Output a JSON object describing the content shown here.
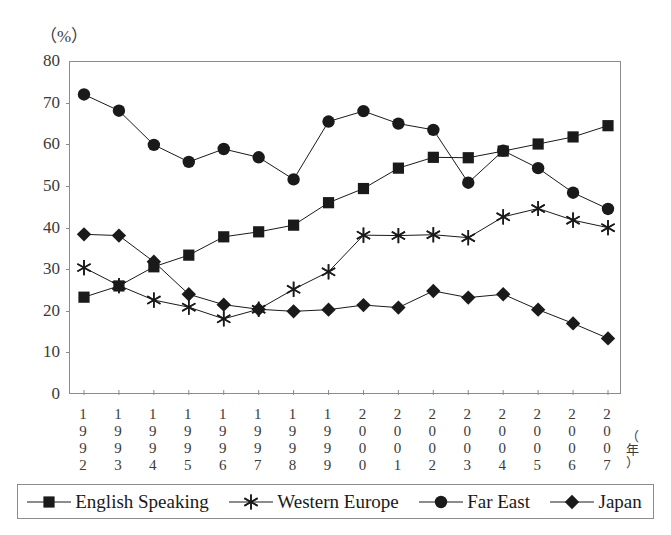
{
  "page": {
    "faint_header": "",
    "unit_label": "（%）",
    "year_axis_label": "（年）"
  },
  "chart_data": {
    "type": "line",
    "title": "",
    "xlabel": "（年）",
    "ylabel": "（%）",
    "ylim": [
      0,
      80
    ],
    "ytick_step": 10,
    "yticks": [
      "0",
      "10",
      "20",
      "30",
      "40",
      "50",
      "60",
      "70",
      "80"
    ],
    "grid": false,
    "legend_position": "bottom",
    "categories": [
      "1992",
      "1993",
      "1994",
      "1995",
      "1996",
      "1997",
      "1998",
      "1999",
      "2000",
      "2001",
      "2002",
      "2003",
      "2004",
      "2005",
      "2006",
      "2007"
    ],
    "series": [
      {
        "name": "English Speaking",
        "marker": "square",
        "color": "#1a1a1a",
        "values": [
          23.5,
          26.2,
          30.8,
          33.6,
          38.0,
          39.2,
          40.8,
          46.2,
          49.6,
          54.5,
          57.1,
          57.0,
          58.6,
          60.3,
          62.0,
          64.7
        ]
      },
      {
        "name": "Western Europe",
        "marker": "star",
        "color": "#1a1a1a",
        "values": [
          30.6,
          26.3,
          22.8,
          21.1,
          18.3,
          20.6,
          25.4,
          29.6,
          38.4,
          38.3,
          38.5,
          37.8,
          42.8,
          44.8,
          42.0,
          40.2
        ]
      },
      {
        "name": "Far East",
        "marker": "circle",
        "color": "#1a1a1a",
        "values": [
          72.2,
          68.3,
          60.1,
          56.0,
          59.1,
          57.1,
          51.8,
          65.7,
          68.2,
          65.2,
          63.7,
          51.0,
          58.7,
          54.5,
          48.6,
          44.7
        ]
      },
      {
        "name": "Japan",
        "marker": "diamond",
        "color": "#1a1a1a",
        "values": [
          38.6,
          38.3,
          32.0,
          24.2,
          21.7,
          20.6,
          20.1,
          20.5,
          21.6,
          21.0,
          25.0,
          23.4,
          24.2,
          20.5,
          17.2,
          13.6
        ]
      }
    ]
  },
  "legend": {
    "items": [
      {
        "label": "English Speaking",
        "marker": "square"
      },
      {
        "label": "Western Europe",
        "marker": "star"
      },
      {
        "label": "Far East",
        "marker": "circle"
      },
      {
        "label": "Japan",
        "marker": "diamond"
      }
    ]
  }
}
